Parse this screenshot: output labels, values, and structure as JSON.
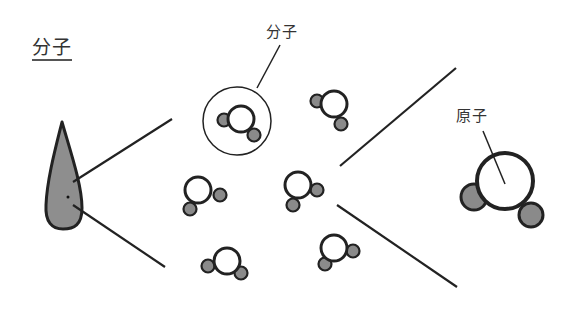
{
  "title": "分子",
  "labels": {
    "molecule": "分子",
    "atom": "原子"
  },
  "colors": {
    "stroke": "#222222",
    "atom_fill": "#8a8a8a",
    "drop_fill": "#8e8e8e",
    "background": "#ffffff"
  },
  "molecules": [
    {
      "cx": 241,
      "cy": 119,
      "r": 13,
      "atoms": [
        {
          "cx": 224,
          "cy": 120,
          "r": 6.5
        },
        {
          "cx": 254,
          "cy": 135,
          "r": 6.5
        }
      ],
      "highlighted": true
    },
    {
      "cx": 334,
      "cy": 104,
      "r": 13,
      "atoms": [
        {
          "cx": 317,
          "cy": 101,
          "r": 6.5
        },
        {
          "cx": 341,
          "cy": 124,
          "r": 6.5
        }
      ]
    },
    {
      "cx": 198,
      "cy": 190,
      "r": 13,
      "atoms": [
        {
          "cx": 220,
          "cy": 195,
          "r": 6.5
        },
        {
          "cx": 190,
          "cy": 209,
          "r": 6.5
        }
      ]
    },
    {
      "cx": 298,
      "cy": 185,
      "r": 13,
      "atoms": [
        {
          "cx": 317,
          "cy": 190,
          "r": 6.5
        },
        {
          "cx": 293,
          "cy": 205,
          "r": 6.5
        }
      ]
    },
    {
      "cx": 227,
      "cy": 261,
      "r": 13,
      "atoms": [
        {
          "cx": 208,
          "cy": 266,
          "r": 6.5
        },
        {
          "cx": 241,
          "cy": 273,
          "r": 6.5
        }
      ]
    },
    {
      "cx": 334,
      "cy": 248,
      "r": 13,
      "atoms": [
        {
          "cx": 353,
          "cy": 251,
          "r": 6.5
        },
        {
          "cx": 325,
          "cy": 264,
          "r": 6.5
        }
      ]
    }
  ],
  "big_molecule": {
    "cx": 505,
    "cy": 181,
    "r": 28,
    "atoms": [
      {
        "cx": 474,
        "cy": 197,
        "r": 13
      },
      {
        "cx": 531,
        "cy": 215,
        "r": 12
      }
    ]
  }
}
